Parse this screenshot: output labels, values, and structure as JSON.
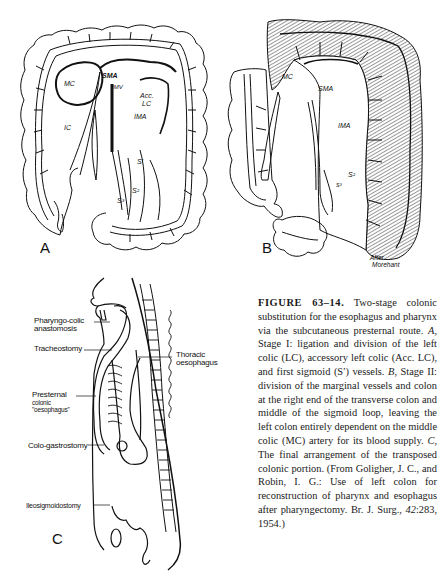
{
  "panel_a": {
    "letter": "A",
    "labels": {
      "mc": "MC",
      "sma": "SMA",
      "imv": "IMV",
      "acc_lc_1": "Acc.",
      "acc_lc_2": "LC",
      "ima": "IMA",
      "ic": "IC",
      "s1": "S′",
      "s2": "S²",
      "s3": "S³"
    }
  },
  "panel_b": {
    "letter": "B",
    "labels": {
      "mc": "MC",
      "sma": "SMA",
      "ima": "IMA",
      "s2": "S²",
      "s3": "S³"
    },
    "credit_line1": "After",
    "credit_line2": "Morehant"
  },
  "panel_c": {
    "letter": "C",
    "labels": {
      "pharyngo_1": "Pharyngo-colic",
      "pharyngo_2": "anastomosis",
      "tracheostomy": "Tracheostomy",
      "thoracic_1": "Thoracic",
      "thoracic_2": "oesophagus",
      "presternal_1": "Presternal",
      "presternal_2": "colonic",
      "presternal_3": "\"oesophagus\"",
      "colo_gastrostomy": "Colo-gastrostomy",
      "ileosigmoidostomy": "Ileosigmoidostomy"
    }
  },
  "caption": {
    "figure_label": "FIGURE 63–14.",
    "t1": " Two-stage colonic substitution for the esophagus and pharynx via the subcutaneous presternal route. ",
    "a": "A",
    "t2": ", Stage I: ligation and division of the left colic (LC), accessory left colic (Acc. LC), and first sigmoid (S′) vessels. ",
    "b": "B",
    "t3": ", Stage II: division of the marginal vessels and colon at the right end of the transverse colon and middle of the sigmoid loop, leaving the left colon entirely dependent on the middle colic (MC) artery for its blood supply. ",
    "c": "C",
    "t4": ", The final arrangement of the transposed colonic portion. (From Goligher, J. C., and Robin, I. G.: Use of left colon for reconstruction of pharynx and esophagus after pharyngectomy. Br. J. Surg., ",
    "vol": "42",
    "t5": ":283, 1954.)"
  }
}
